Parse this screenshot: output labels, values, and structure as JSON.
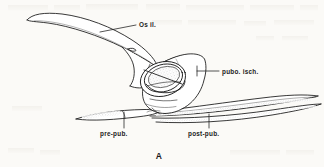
{
  "figure": {
    "letter": "A",
    "background_color": "#fbfaf7",
    "ink_color": "#151515"
  },
  "labels": [
    {
      "id": "os-il",
      "text": "Os il.",
      "x": 139,
      "y": 27,
      "leader": {
        "x1": 100,
        "y1": 32,
        "x2": 136,
        "y2": 25
      }
    },
    {
      "id": "pubo-isch",
      "text": "pubo. isch.",
      "x": 222,
      "y": 74,
      "leader": {
        "x1": 197,
        "y1": 71,
        "x2": 219,
        "y2": 71
      }
    },
    {
      "id": "pre-pub",
      "text": "pre-pub.",
      "x": 100,
      "y": 136,
      "leader": {
        "x1": 124,
        "y1": 112,
        "x2": 124,
        "y2": 128
      }
    },
    {
      "id": "post-pub",
      "text": "post-pub.",
      "x": 188,
      "y": 136,
      "leader": {
        "x1": 209,
        "y1": 114,
        "x2": 209,
        "y2": 128
      }
    }
  ],
  "ghost_text": {
    "visible": true,
    "description": "faint bleed-through printed text behind drawing, illegible"
  },
  "structures": [
    {
      "id": "ilium",
      "label_ref": "os-il"
    },
    {
      "id": "pubo-ischium",
      "label_ref": "pubo-isch"
    },
    {
      "id": "prepubis",
      "label_ref": "pre-pub"
    },
    {
      "id": "postpubis",
      "label_ref": "post-pub"
    },
    {
      "id": "acetabulum",
      "label_ref": null
    }
  ]
}
